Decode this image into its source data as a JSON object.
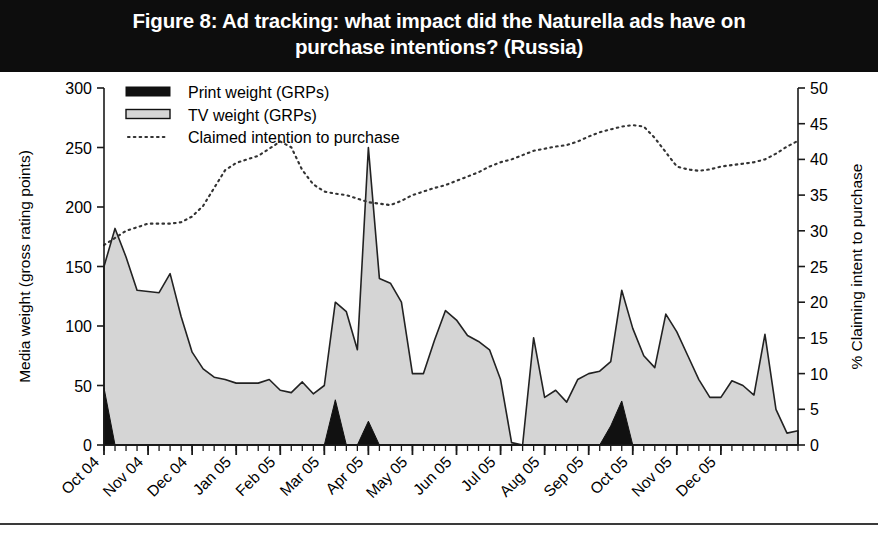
{
  "figure": {
    "title": "Figure 8: Ad tracking: what impact did the Naturella ads have on purchase intentions? (Russia)",
    "title_line1": "Figure 8: Ad tracking: what impact did the Naturella ads have on",
    "title_line2": "purchase intentions? (Russia)",
    "banner_color": "#0d0d0d",
    "banner_text_color": "#ffffff"
  },
  "colors": {
    "print_weight": "#111111",
    "tv_weight_fill": "#d5d5d5",
    "tv_weight_stroke": "#222222",
    "intention_line": "#333333",
    "axis": "#1a1a1a",
    "background": "#ffffff"
  },
  "legend": {
    "items": [
      {
        "label": "Print weight (GRPs)",
        "marker": "filled-black-bar"
      },
      {
        "label": "TV weight (GRPs)",
        "marker": "outlined-gray-bar"
      },
      {
        "label": "Claimed intention to purchase",
        "marker": "dotted-line"
      }
    ]
  },
  "chart_data": {
    "type": "area",
    "title": "Figure 8: Ad tracking: what impact did the Naturella ads have on purchase intentions? (Russia)",
    "xlabel": "",
    "ylabel": "Media weight (gross rating points)",
    "y2label": "% Claiming intent to purchase",
    "ylim": [
      0,
      300
    ],
    "y2lim": [
      0,
      50
    ],
    "y_ticks": [
      0,
      50,
      100,
      150,
      200,
      250,
      300
    ],
    "y2_ticks": [
      0,
      5,
      10,
      15,
      20,
      25,
      30,
      35,
      40,
      45,
      50
    ],
    "grid": false,
    "legend_position": "top-left",
    "x_tick_labels": [
      "Oct 04",
      "Nov 04",
      "Dec 04",
      "Jan 05",
      "Feb 05",
      "Mar 05",
      "Apr 05",
      "May 05",
      "Jun 05",
      "Jul 05",
      "Aug 05",
      "Sep 05",
      "Oct 05",
      "Nov 05",
      "Dec 05"
    ],
    "x_label_rotation": 45,
    "x_minor_ticks_per_month": 4,
    "n_points": 63,
    "series": [
      {
        "name": "TV weight (GRPs)",
        "axis": "left",
        "kind": "area",
        "values": [
          150,
          182,
          158,
          130,
          129,
          128,
          144,
          108,
          78,
          64,
          57,
          55,
          52,
          52,
          52,
          55,
          46,
          44,
          53,
          43,
          50,
          120,
          112,
          80,
          250,
          140,
          136,
          120,
          60,
          60,
          88,
          113,
          105,
          92,
          87,
          80,
          55,
          2,
          0,
          90,
          40,
          46,
          36,
          55,
          60,
          62,
          70,
          130,
          98,
          75,
          65,
          110,
          95,
          75,
          55,
          40,
          40,
          54,
          50,
          42,
          93,
          30,
          10,
          12
        ]
      },
      {
        "name": "Print weight (GRPs)",
        "axis": "left",
        "kind": "area",
        "values": [
          48,
          0,
          0,
          0,
          0,
          0,
          0,
          0,
          0,
          0,
          0,
          0,
          0,
          0,
          0,
          0,
          0,
          0,
          0,
          0,
          0,
          38,
          0,
          0,
          20,
          0,
          0,
          0,
          0,
          0,
          0,
          0,
          0,
          0,
          0,
          0,
          0,
          0,
          0,
          0,
          0,
          0,
          0,
          0,
          0,
          0,
          16,
          37,
          0,
          0,
          0,
          0,
          0,
          0,
          0,
          0,
          0,
          0,
          0,
          0,
          0,
          0,
          0,
          0
        ]
      },
      {
        "name": "Claimed intention to purchase",
        "axis": "right",
        "kind": "dotted-line",
        "values": [
          28,
          29,
          30,
          30.5,
          31,
          31,
          31,
          31.2,
          32,
          33.5,
          36,
          38.5,
          39.5,
          40,
          40.5,
          41.5,
          42.5,
          41.7,
          38.5,
          36.5,
          35.5,
          35.2,
          35,
          34.5,
          34,
          33.8,
          33.6,
          34.2,
          35,
          35.5,
          36,
          36.4,
          37,
          37.6,
          38.2,
          39,
          39.6,
          40,
          40.6,
          41.2,
          41.5,
          41.8,
          42,
          42.5,
          43.2,
          43.8,
          44.2,
          44.6,
          44.8,
          44.6,
          43,
          41,
          39,
          38.6,
          38.4,
          38.6,
          39,
          39.2,
          39.4,
          39.6,
          40,
          40.8,
          41.8,
          42.6
        ]
      }
    ]
  }
}
